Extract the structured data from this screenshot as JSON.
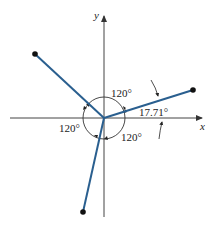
{
  "diagram": {
    "type": "vector diagram",
    "axes": {
      "x_label": "x",
      "y_label": "y"
    },
    "origin": [
      104,
      118
    ],
    "vectors": [
      {
        "name": "upper-left",
        "end": [
          35,
          54
        ]
      },
      {
        "name": "right",
        "end": [
          193,
          90
        ]
      },
      {
        "name": "lower",
        "end": [
          83,
          212
        ]
      }
    ],
    "angle_labels": {
      "top": "120°",
      "left": "120°",
      "bottom": "120°",
      "right": "17.71°"
    },
    "colors": {
      "vector": "#2a5f8f",
      "axis": "#444444",
      "arc": "#333333",
      "point": "#111111"
    }
  }
}
